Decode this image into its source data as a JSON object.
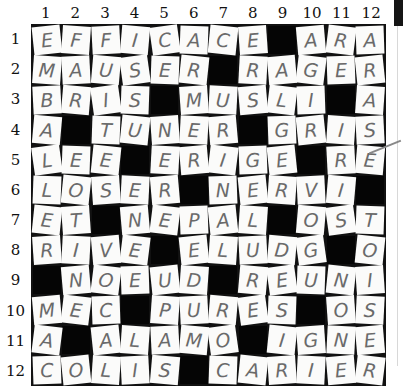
{
  "puzzle": {
    "column_numbers": [
      "1",
      "2",
      "3",
      "4",
      "5",
      "6",
      "7",
      "8",
      "9",
      "10",
      "11",
      "12"
    ],
    "row_numbers": [
      "1",
      "2",
      "3",
      "4",
      "5",
      "6",
      "7",
      "8",
      "9",
      "10",
      "11",
      "12"
    ],
    "block_symbol": "#",
    "rows": [
      [
        "E",
        "F",
        "F",
        "I",
        "C",
        "A",
        "C",
        "E",
        "#",
        "A",
        "R",
        "A"
      ],
      [
        "M",
        "A",
        "U",
        "S",
        "E",
        "R",
        "#",
        "R",
        "A",
        "G",
        "E",
        "R"
      ],
      [
        "B",
        "R",
        "I",
        "S",
        "#",
        "M",
        "U",
        "S",
        "L",
        "I",
        "#",
        "A"
      ],
      [
        "A",
        "#",
        "T",
        "U",
        "N",
        "E",
        "R",
        "#",
        "G",
        "R",
        "I",
        "S"
      ],
      [
        "L",
        "E",
        "E",
        "#",
        "E",
        "R",
        "I",
        "G",
        "E",
        "#",
        "R",
        "E"
      ],
      [
        "L",
        "O",
        "S",
        "E",
        "R",
        "#",
        "N",
        "E",
        "R",
        "V",
        "I",
        "#"
      ],
      [
        "E",
        "T",
        "#",
        "N",
        "E",
        "P",
        "A",
        "L",
        "#",
        "O",
        "S",
        "T"
      ],
      [
        "R",
        "I",
        "V",
        "E",
        "#",
        "E",
        "L",
        "U",
        "D",
        "G",
        "#",
        "O"
      ],
      [
        "#",
        "N",
        "O",
        "E",
        "U",
        "D",
        "#",
        "R",
        "E",
        "U",
        "N",
        "I"
      ],
      [
        "M",
        "E",
        "C",
        "#",
        "P",
        "U",
        "R",
        "E",
        "S",
        "#",
        "O",
        "S"
      ],
      [
        "A",
        "#",
        "A",
        "L",
        "A",
        "M",
        "O",
        "#",
        "I",
        "G",
        "N",
        "E"
      ],
      [
        "C",
        "O",
        "L",
        "I",
        "S",
        "#",
        "C",
        "A",
        "R",
        "I",
        "E",
        "R"
      ]
    ]
  }
}
